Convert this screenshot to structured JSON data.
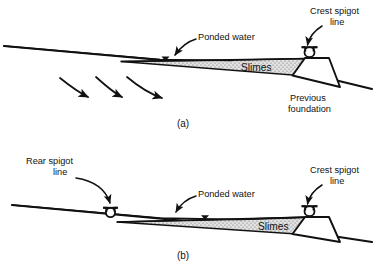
{
  "figure": {
    "background_color": "#ffffff",
    "ink_color": "#111111",
    "slimes_fill_color": "#d9d9d9"
  },
  "panels": [
    {
      "caption": "(a)",
      "labels": {
        "ponded_water": "Ponded water",
        "slimes": "Slimes",
        "crest_spigot_line_1": "Crest spigot",
        "crest_spigot_line_2": "line",
        "previous_foundation_1": "Previous",
        "previous_foundation_2": "foundation"
      },
      "icons": {
        "water_table": "water-table-triangle",
        "spigot": "spigot-symbol",
        "flow_arrows": "curved-flow-arrow"
      },
      "flow_arrow_count": 3
    },
    {
      "caption": "(b)",
      "labels": {
        "rear_spigot_line_1": "Rear spigot",
        "rear_spigot_line_2": "line",
        "ponded_water": "Ponded water",
        "slimes": "Slimes",
        "crest_spigot_line_1": "Crest spigot",
        "crest_spigot_line_2": "line"
      },
      "icons": {
        "water_table": "water-table-triangle",
        "spigot": "spigot-symbol"
      },
      "flow_arrow_count": 0
    }
  ]
}
